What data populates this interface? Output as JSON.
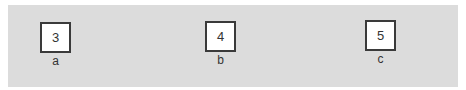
{
  "diagram": {
    "background_color": "#dcdcdc",
    "cells": [
      {
        "value": "3",
        "label": "a"
      },
      {
        "value": "4",
        "label": "b"
      },
      {
        "value": "5",
        "label": "c"
      }
    ]
  }
}
